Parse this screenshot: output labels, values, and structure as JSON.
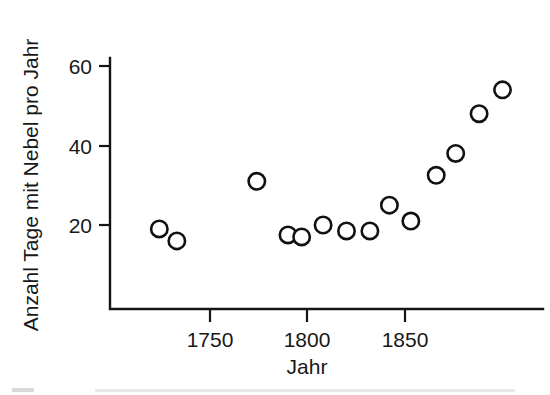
{
  "chart_data": {
    "type": "scatter",
    "title": "",
    "xlabel": "Jahr",
    "ylabel": "Anzahl Tage mit Nebel pro Jahr",
    "xlim": [
      1712,
      1908
    ],
    "ylim": [
      0,
      68
    ],
    "xticks": [
      1750,
      1800,
      1850
    ],
    "xticklabels": [
      "1750",
      "1800",
      "1850"
    ],
    "yticks": [
      20,
      40,
      60
    ],
    "yticklabels": [
      "20",
      "40",
      "60"
    ],
    "grid": false,
    "legend": null,
    "marker": "open-circle",
    "series": [
      {
        "name": "Nebeltage",
        "x": [
          1724,
          1733,
          1774,
          1790,
          1797,
          1808,
          1820,
          1832,
          1842,
          1853,
          1866,
          1876,
          1888,
          1900
        ],
        "y": [
          19,
          16,
          31,
          17.5,
          17,
          20,
          18.5,
          18.5,
          25,
          21,
          32.5,
          38,
          48,
          54
        ]
      }
    ],
    "points": [
      {
        "x": 1724,
        "y": 19
      },
      {
        "x": 1733,
        "y": 16
      },
      {
        "x": 1774,
        "y": 31
      },
      {
        "x": 1790,
        "y": 17.5
      },
      {
        "x": 1797,
        "y": 17
      },
      {
        "x": 1808,
        "y": 20
      },
      {
        "x": 1820,
        "y": 18.5
      },
      {
        "x": 1832,
        "y": 18.5
      },
      {
        "x": 1842,
        "y": 25
      },
      {
        "x": 1853,
        "y": 21
      },
      {
        "x": 1866,
        "y": 32.5
      },
      {
        "x": 1876,
        "y": 38
      },
      {
        "x": 1888,
        "y": 48
      },
      {
        "x": 1900,
        "y": 54
      }
    ]
  },
  "axes": {
    "y_title": "Anzahl Tage mit Nebel pro Jahr",
    "x_title": "Jahr",
    "y_tick_labels": [
      "60",
      "40",
      "20"
    ],
    "x_tick_labels": [
      "1750",
      "1800",
      "1850"
    ]
  },
  "colors": {
    "ink": "#141414",
    "marker_stroke": "#111111",
    "marker_fill": "#ffffff",
    "background": "#ffffff"
  }
}
